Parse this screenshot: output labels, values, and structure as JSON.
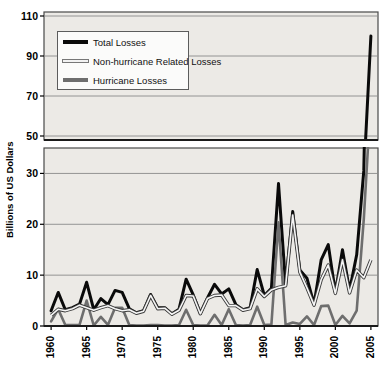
{
  "chart_data": {
    "type": "line",
    "title": "",
    "xlabel": "",
    "ylabel": "Billions of US Dollars",
    "grid": true,
    "legend_position": "top-left",
    "broken_axis": true,
    "lower_panel": {
      "ylim": [
        0,
        35
      ],
      "yticks": [
        0,
        10,
        20,
        30
      ]
    },
    "upper_panel": {
      "ylim": [
        48,
        112
      ],
      "yticks": [
        50,
        70,
        90,
        110
      ]
    },
    "xlim": [
      1959,
      2006
    ],
    "xticks": [
      1960,
      1965,
      1970,
      1975,
      1980,
      1985,
      1990,
      1995,
      2000,
      2005
    ],
    "x": [
      1960,
      1961,
      1962,
      1963,
      1964,
      1965,
      1966,
      1967,
      1968,
      1969,
      1970,
      1971,
      1972,
      1973,
      1974,
      1975,
      1976,
      1977,
      1978,
      1979,
      1980,
      1981,
      1982,
      1983,
      1984,
      1985,
      1986,
      1987,
      1988,
      1989,
      1990,
      1991,
      1992,
      1993,
      1994,
      1995,
      1996,
      1997,
      1998,
      1999,
      2000,
      2001,
      2002,
      2003,
      2004,
      2005
    ],
    "series": [
      {
        "name": "Total Losses",
        "color": "#0a0a0a",
        "width": 3.0,
        "values": [
          3.0,
          6.6,
          3.2,
          3.6,
          4.3,
          8.6,
          3.2,
          5.4,
          4.2,
          7.0,
          6.6,
          3.4,
          2.6,
          3.0,
          6.2,
          3.6,
          3.6,
          2.4,
          3.3,
          9.2,
          6.1,
          2.5,
          5.5,
          8.2,
          6.3,
          7.3,
          4.2,
          3.2,
          3.6,
          11.1,
          6.0,
          7.4,
          28.0,
          8.1,
          22.5,
          11.0,
          9.4,
          4.3,
          13.0,
          16.0,
          6.6,
          15.0,
          7.0,
          14.0,
          30.5,
          100.0
        ]
      },
      {
        "name": "Non-hurricane Related Losses",
        "color": "#f5f5f5",
        "width": 1.6,
        "values": [
          2.1,
          3.3,
          3.0,
          3.4,
          4.1,
          3.6,
          3.1,
          3.6,
          4.0,
          3.4,
          3.0,
          3.2,
          2.5,
          2.9,
          6.0,
          3.4,
          3.5,
          2.3,
          3.1,
          6.0,
          5.9,
          2.4,
          5.4,
          6.0,
          6.1,
          4.0,
          4.0,
          3.1,
          3.4,
          7.3,
          5.8,
          7.1,
          7.6,
          7.9,
          21.8,
          10.6,
          7.5,
          4.1,
          9.1,
          12.0,
          6.4,
          13.0,
          6.5,
          11.0,
          9.5,
          13.0
        ]
      },
      {
        "name": "Hurricane Losses",
        "color": "#6e6e6e",
        "width": 2.6,
        "values": [
          0.9,
          3.3,
          0.2,
          0.2,
          0.2,
          5.0,
          0.1,
          1.8,
          0.2,
          3.6,
          3.6,
          0.2,
          0.1,
          0.1,
          0.2,
          0.2,
          0.1,
          0.1,
          0.2,
          3.2,
          0.2,
          0.1,
          0.1,
          2.2,
          0.2,
          3.3,
          0.2,
          0.1,
          0.2,
          3.8,
          0.2,
          0.3,
          20.4,
          0.2,
          0.7,
          0.4,
          1.9,
          0.2,
          3.9,
          4.0,
          0.2,
          2.0,
          0.5,
          3.0,
          21.0,
          45.0
        ]
      }
    ]
  },
  "legend": {
    "items": [
      {
        "label": "Total Losses"
      },
      {
        "label": "Non-hurricane Related Losses"
      },
      {
        "label": "Hurricane Losses"
      }
    ]
  }
}
